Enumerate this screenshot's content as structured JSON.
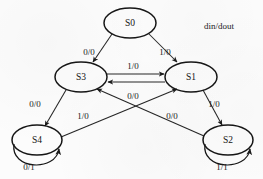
{
  "diagram": {
    "type": "state-transition-diagram",
    "legend": "din/dout",
    "states": [
      {
        "id": "S0",
        "label": "S0",
        "cx": 130,
        "cy": 23,
        "rx": 26,
        "ry": 15
      },
      {
        "id": "S3",
        "label": "S3",
        "cx": 81,
        "cy": 77,
        "rx": 26,
        "ry": 15
      },
      {
        "id": "S1",
        "label": "S1",
        "cx": 191,
        "cy": 77,
        "rx": 26,
        "ry": 15
      },
      {
        "id": "S4",
        "label": "S4",
        "cx": 37,
        "cy": 140,
        "rx": 25,
        "ry": 15
      },
      {
        "id": "S2",
        "label": "S2",
        "cx": 228,
        "cy": 140,
        "rx": 25,
        "ry": 15
      }
    ],
    "transitions": [
      {
        "from": "S0",
        "to": "S3",
        "label": "0/0",
        "label_x": 89,
        "label_y": 53
      },
      {
        "from": "S0",
        "to": "S1",
        "label": "1/0",
        "label_x": 165,
        "label_y": 53
      },
      {
        "from": "S3",
        "to": "S1",
        "label": "1/0",
        "label_x": 133,
        "label_y": 67
      },
      {
        "from": "S1",
        "to": "S3",
        "label": "0/0",
        "label_x": 133,
        "label_y": 97
      },
      {
        "from": "S3",
        "to": "S4",
        "label": "0/0",
        "label_x": 35,
        "label_y": 105
      },
      {
        "from": "S1",
        "to": "S2",
        "label": "1/0",
        "label_x": 214,
        "label_y": 105
      },
      {
        "from": "S4",
        "to": "S1",
        "label": "1/0",
        "label_x": 83,
        "label_y": 117
      },
      {
        "from": "S2",
        "to": "S3",
        "label": "0/0",
        "label_x": 172,
        "label_y": 117
      },
      {
        "from": "S4",
        "to": "S4",
        "label": "0/1",
        "label_x": 29,
        "label_y": 168
      },
      {
        "from": "S2",
        "to": "S2",
        "label": "1/1",
        "label_x": 222,
        "label_y": 168
      }
    ]
  }
}
